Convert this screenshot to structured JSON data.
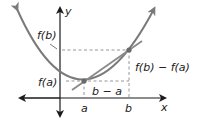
{
  "diagram": {
    "type": "secant-line-on-parabola",
    "axes": {
      "x_label": "x",
      "y_label": "y"
    },
    "points": [
      {
        "name": "a",
        "x_label": "a",
        "y_label": "f(a)"
      },
      {
        "name": "b",
        "x_label": "b",
        "y_label": "f(b)"
      }
    ],
    "annotations": {
      "run": "b − a",
      "rise": "f(b) − f(a)"
    },
    "colors": {
      "curve": "#7a7a7a",
      "secant": "#8a8a8a",
      "axes": "#1a1a1a",
      "dashed": "#8a8a8a",
      "points": "#6a6a6a"
    }
  }
}
